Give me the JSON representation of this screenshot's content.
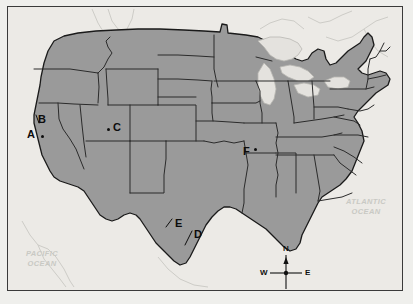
{
  "map": {
    "title": "United States outline map with lettered location markers",
    "colors": {
      "page_background": "#efefec",
      "plate_background": "#eceae6",
      "frame_border": "#3a3a3a",
      "land_fill": "#9a9a9a",
      "state_border": "#2b2b2b",
      "national_border": "#1a1a1a",
      "lake_fill": "#e4e2de",
      "coastline_faint": "#cdccc7",
      "label_text": "#0d0d0d",
      "ocean_text": "#c9c9c4"
    },
    "point_markers": [
      {
        "label": "A",
        "label_x": 19,
        "label_y": 122,
        "dot_x": 33,
        "dot_y": 128,
        "leader": false
      },
      {
        "label": "B",
        "label_x": 30,
        "label_y": 107,
        "dot_x": 0,
        "dot_y": 0,
        "leader": true
      },
      {
        "label": "C",
        "label_x": 105,
        "label_y": 115,
        "dot_x": 99,
        "dot_y": 121,
        "leader": false
      },
      {
        "label": "D",
        "label_x": 186,
        "label_y": 222,
        "dot_x": 0,
        "dot_y": 0,
        "leader": true
      },
      {
        "label": "E",
        "label_x": 167,
        "label_y": 211,
        "dot_x": 0,
        "dot_y": 0,
        "leader": true
      },
      {
        "label": "F",
        "label_x": 235,
        "label_y": 139,
        "dot_x": 246,
        "dot_y": 143,
        "leader": false
      }
    ],
    "ocean_labels": [
      {
        "line1": "PACIFIC",
        "line2": "OCEAN",
        "x": 14,
        "y": 248
      },
      {
        "line1": "ATLANTIC",
        "line2": "OCEAN",
        "x": 343,
        "y": 197
      }
    ],
    "compass": {
      "center_x": 285,
      "center_y": 262,
      "north": "N",
      "east": "E",
      "south": "S",
      "west": "W"
    }
  }
}
